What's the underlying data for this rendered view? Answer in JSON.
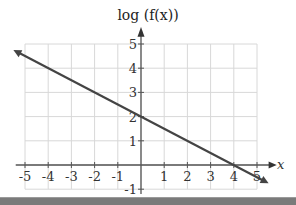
{
  "chart_data": {
    "type": "line",
    "title": "log (f(x))",
    "xlabel": "x",
    "ylabel": "log (f(x))",
    "xlim": [
      -5,
      5
    ],
    "ylim": [
      -1,
      5
    ],
    "grid": true,
    "x_ticks": [
      "-5",
      "-4",
      "-3",
      "-2",
      "-1",
      "1",
      "2",
      "3",
      "4",
      "5"
    ],
    "y_ticks": [
      "-1",
      "1",
      "2",
      "3",
      "4",
      "5"
    ],
    "series": [
      {
        "name": "log(f(x))",
        "x": [
          -5.5,
          5.5
        ],
        "y": [
          4.75,
          -0.75
        ],
        "color": "#444444",
        "arrows": "both"
      }
    ],
    "points": [
      {
        "x": 0,
        "y": 2
      },
      {
        "x": 4,
        "y": 0
      }
    ],
    "slope": -0.5,
    "intercept": 2
  },
  "labels": {
    "title": "log (f(x))",
    "x_axis": "x"
  }
}
